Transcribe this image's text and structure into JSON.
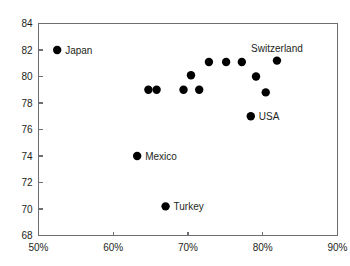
{
  "chart_data": {
    "type": "scatter",
    "title": "",
    "subtitle": "",
    "xlabel": "",
    "ylabel": "",
    "xlim": [
      50,
      90
    ],
    "ylim": [
      68,
      84
    ],
    "xticks": [
      50,
      60,
      70,
      80,
      90
    ],
    "xtick_labels": [
      "50%",
      "60%",
      "70%",
      "80%",
      "90%"
    ],
    "yticks": [
      68,
      70,
      72,
      74,
      76,
      78,
      80,
      82,
      84
    ],
    "ytick_labels": [
      "68",
      "70",
      "72",
      "74",
      "76",
      "78",
      "80",
      "82",
      "84"
    ],
    "grid": false,
    "legend": "none",
    "marker_color": "#000000",
    "axis_color": "#6d6e71",
    "text_color": "#231f20",
    "points": [
      {
        "label": "Japan",
        "x": 52.5,
        "y": 82.0,
        "label_pos": "right"
      },
      {
        "label": "",
        "x": 64.7,
        "y": 79.0,
        "label_pos": "none"
      },
      {
        "label": "",
        "x": 65.8,
        "y": 79.0,
        "label_pos": "none"
      },
      {
        "label": "Mexico",
        "x": 63.2,
        "y": 74.0,
        "label_pos": "right"
      },
      {
        "label": "Turkey",
        "x": 67.0,
        "y": 70.2,
        "label_pos": "right"
      },
      {
        "label": "",
        "x": 69.4,
        "y": 79.0,
        "label_pos": "none"
      },
      {
        "label": "",
        "x": 71.5,
        "y": 79.0,
        "label_pos": "none"
      },
      {
        "label": "",
        "x": 70.4,
        "y": 80.1,
        "label_pos": "none"
      },
      {
        "label": "",
        "x": 72.8,
        "y": 81.1,
        "label_pos": "none"
      },
      {
        "label": "",
        "x": 75.1,
        "y": 81.1,
        "label_pos": "none"
      },
      {
        "label": "",
        "x": 77.2,
        "y": 81.1,
        "label_pos": "none"
      },
      {
        "label": "",
        "x": 79.1,
        "y": 80.0,
        "label_pos": "none"
      },
      {
        "label": "",
        "x": 80.4,
        "y": 78.8,
        "label_pos": "none"
      },
      {
        "label": "USA",
        "x": 78.4,
        "y": 77.0,
        "label_pos": "right"
      },
      {
        "label": "Switzerland",
        "x": 81.9,
        "y": 81.2,
        "label_pos": "above"
      }
    ]
  }
}
